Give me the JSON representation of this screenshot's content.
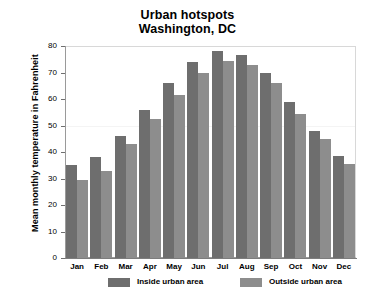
{
  "chart_data": {
    "type": "bar",
    "title": "Urban hotspots\nWashington, DC",
    "title_lines": [
      "Urban hotspots",
      "Washington, DC"
    ],
    "xlabel": "",
    "ylabel": "Mean monthly temperature in Fahrenheit",
    "categories": [
      "Jan",
      "Feb",
      "Mar",
      "Apr",
      "May",
      "Jun",
      "Jul",
      "Aug",
      "Sep",
      "Oct",
      "Nov",
      "Dec"
    ],
    "series": [
      {
        "name": "Inside urban area",
        "color": "#6e6e6e",
        "values": [
          35,
          38,
          46,
          56,
          66,
          74,
          78,
          76.5,
          70,
          59,
          48,
          38.5
        ]
      },
      {
        "name": "Outside urban area",
        "color": "#8d8d8d",
        "values": [
          29.5,
          33,
          43,
          52.5,
          61.5,
          70,
          74.5,
          73,
          66,
          54.5,
          45,
          35.5
        ]
      }
    ],
    "ylim": [
      0,
      80
    ],
    "yticks": [
      0,
      10,
      20,
      30,
      40,
      50,
      60,
      70,
      80
    ],
    "ytick_labels": [
      "0",
      "10",
      "20",
      "30",
      "40",
      "50",
      "60",
      "70",
      "80"
    ],
    "gridlines": [
      50
    ],
    "grid": false,
    "legend_position": "below-axis",
    "legend_entries": [
      "Inside urban area",
      "Outside urban area"
    ]
  }
}
